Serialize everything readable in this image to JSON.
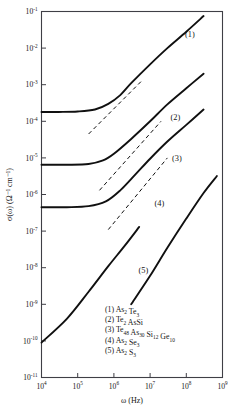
{
  "chart_data": {
    "type": "line",
    "title": "",
    "xlabel": "ω (Hz)",
    "ylabel": "σ(ω) (Ω⁻¹ cm⁻¹)",
    "xscale": "log",
    "yscale": "log",
    "xlim": [
      10000,
      1000000000
    ],
    "ylim": [
      1e-11,
      0.1
    ],
    "xticks": [
      {
        "value": 10000,
        "label": "10",
        "exp": "4"
      },
      {
        "value": 100000,
        "label": "10",
        "exp": "5"
      },
      {
        "value": 1000000,
        "label": "10",
        "exp": "6"
      },
      {
        "value": 10000000,
        "label": "10",
        "exp": "7"
      },
      {
        "value": 100000000,
        "label": "10",
        "exp": "8"
      },
      {
        "value": 1000000000,
        "label": "10",
        "exp": "9"
      }
    ],
    "yticks": [
      {
        "value": 0.1,
        "label": "10",
        "exp": "-1"
      },
      {
        "value": 0.01,
        "label": "10",
        "exp": "-2"
      },
      {
        "value": 0.001,
        "label": "10",
        "exp": "-3"
      },
      {
        "value": 0.0001,
        "label": "10",
        "exp": "-4"
      },
      {
        "value": 1e-05,
        "label": "10",
        "exp": "-5"
      },
      {
        "value": 1e-06,
        "label": "10",
        "exp": "-6"
      },
      {
        "value": 1e-07,
        "label": "10",
        "exp": "-7"
      },
      {
        "value": 1e-08,
        "label": "10",
        "exp": "-8"
      },
      {
        "value": 1e-09,
        "label": "10",
        "exp": "-9"
      },
      {
        "value": 1e-10,
        "label": "10",
        "exp": "-10"
      },
      {
        "value": 1e-11,
        "label": "10",
        "exp": "-11"
      }
    ],
    "grid": false,
    "legend_position": "inside-bottom-right",
    "series": [
      {
        "name": "(1)",
        "material": "As2Te3",
        "label_x": 125000000,
        "label_y": 0.02,
        "points": [
          [
            10000,
            0.00018
          ],
          [
            30000,
            0.00018
          ],
          [
            100000,
            0.000185
          ],
          [
            300000,
            0.00021
          ],
          [
            700000,
            0.0003
          ],
          [
            1500000,
            0.00052
          ],
          [
            3000000,
            0.0011
          ],
          [
            10000000,
            0.0036
          ],
          [
            30000000,
            0.01
          ],
          [
            100000000,
            0.028
          ],
          [
            300000000,
            0.075
          ]
        ],
        "dashed_asymptote": [
          [
            200000,
            4.5e-05
          ],
          [
            6000000,
            0.0013
          ]
        ]
      },
      {
        "name": "(2)",
        "material": "Te2AsSi",
        "label_x": 50000000,
        "label_y": 0.00011,
        "points": [
          [
            10000,
            6.5e-06
          ],
          [
            50000,
            6.5e-06
          ],
          [
            200000,
            6.8e-06
          ],
          [
            500000,
            8.5e-06
          ],
          [
            1000000,
            1.3e-05
          ],
          [
            3000000,
            3.3e-05
          ],
          [
            10000000,
            0.0001
          ],
          [
            30000000,
            0.00029
          ],
          [
            100000000,
            0.0008
          ],
          [
            300000000,
            0.002
          ]
        ],
        "dashed_asymptote": [
          [
            400000,
            1.3e-06
          ],
          [
            20000000,
            0.0001
          ]
        ]
      },
      {
        "name": "(3)",
        "material": "Te48As30Si12Ge10",
        "label_x": 55000000,
        "label_y": 8e-06,
        "points": [
          [
            10000,
            4.5e-07
          ],
          [
            50000,
            4.5e-07
          ],
          [
            200000,
            4.8e-07
          ],
          [
            600000,
            6.5e-07
          ],
          [
            1500000,
            1.3e-06
          ],
          [
            4000000,
            3.6e-06
          ],
          [
            10000000,
            9.5e-06
          ],
          [
            30000000,
            2.8e-05
          ],
          [
            100000000,
            8e-05
          ],
          [
            300000000,
            0.00021
          ]
        ],
        "dashed_asymptote": [
          [
            700000,
            1.1e-07
          ],
          [
            30000000,
            1e-05
          ]
        ]
      },
      {
        "name": "(4)",
        "material": "As2Se3",
        "label_x": 18000000,
        "label_y": 5e-07,
        "points": [
          [
            3000000,
            1e-09
          ],
          [
            10000000,
            6e-09
          ],
          [
            30000000,
            3.5e-08
          ],
          [
            100000000,
            2.2e-07
          ],
          [
            300000000,
            1.1e-06
          ],
          [
            700000000,
            3.2e-06
          ]
        ],
        "dashed_asymptote": null
      },
      {
        "name": "(5)",
        "material": "As2S3",
        "label_x": 6500000,
        "label_y": 7e-09,
        "points": [
          [
            10000,
            9e-11
          ],
          [
            50000,
            4e-10
          ],
          [
            200000,
            2.2e-09
          ],
          [
            700000,
            1.1e-08
          ],
          [
            2000000,
            4e-08
          ],
          [
            5000000,
            1.3e-07
          ]
        ],
        "dashed_asymptote": null
      }
    ],
    "legend_entries": [
      {
        "index": "(1)",
        "formula_parts": [
          {
            "t": "As",
            "s": ""
          },
          {
            "t": "",
            "s": "2"
          },
          {
            "t": " Te",
            "s": ""
          },
          {
            "t": "",
            "s": "3"
          }
        ],
        "plain": "(1)  As2 Te3"
      },
      {
        "index": "(2)",
        "formula_parts": [
          {
            "t": "Te",
            "s": ""
          },
          {
            "t": "",
            "s": "2"
          },
          {
            "t": " AsSi",
            "s": ""
          }
        ],
        "plain": "(2)  Te2 AsSi"
      },
      {
        "index": "(3)",
        "formula_parts": [
          {
            "t": "Te",
            "s": ""
          },
          {
            "t": "",
            "s": "48"
          },
          {
            "t": " As",
            "s": ""
          },
          {
            "t": "",
            "s": "30"
          },
          {
            "t": " Si",
            "s": ""
          },
          {
            "t": "",
            "s": "12"
          },
          {
            "t": " Ge",
            "s": ""
          },
          {
            "t": "",
            "s": "10"
          }
        ],
        "plain": "(3)  Te48 As30 Si12 Ge10"
      },
      {
        "index": "(4)",
        "formula_parts": [
          {
            "t": "As",
            "s": ""
          },
          {
            "t": "",
            "s": "2"
          },
          {
            "t": " Se",
            "s": ""
          },
          {
            "t": "",
            "s": "3"
          }
        ],
        "plain": "(4)  As2 Se3"
      },
      {
        "index": "(5)",
        "formula_parts": [
          {
            "t": "As",
            "s": ""
          },
          {
            "t": "",
            "s": "2"
          },
          {
            "t": " S",
            "s": ""
          },
          {
            "t": "",
            "s": "3"
          }
        ],
        "plain": "(5)  As2 S3"
      }
    ],
    "colors": {
      "curve": "#101010",
      "axis": "#3f3f46",
      "background": "#ffffff",
      "text": "#151515"
    }
  }
}
